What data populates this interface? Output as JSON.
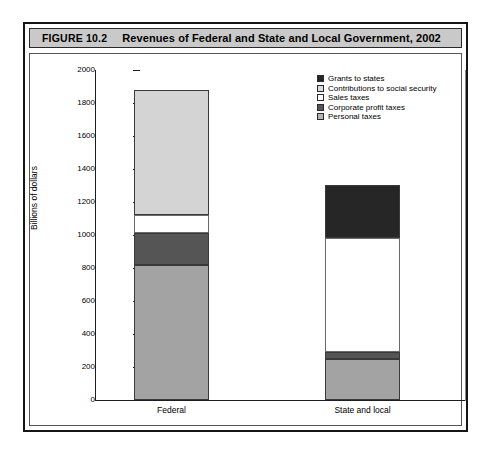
{
  "figure": {
    "label": "FIGURE 10.2",
    "title": "Revenues of Federal and State and Local Government, 2002"
  },
  "chart_data": {
    "type": "bar",
    "stacked": true,
    "title": "Revenues of Federal and State and Local Government, 2002",
    "xlabel": "",
    "ylabel": "Billions of dollars",
    "categories": [
      "Federal",
      "State and local"
    ],
    "ylim": [
      0,
      2000
    ],
    "ytick_step": 200,
    "yticks": [
      2000,
      1800,
      1600,
      1400,
      1200,
      1000,
      800,
      600,
      400,
      200,
      0
    ],
    "grid": false,
    "legend_position": "top-right",
    "series": [
      {
        "name": "Grants to states",
        "color": "#262626",
        "values": [
          0,
          325
        ]
      },
      {
        "name": "Contributions to social security",
        "color": "#d4d4d4",
        "values": [
          760,
          0
        ]
      },
      {
        "name": "Sales taxes",
        "color": "#ffffff",
        "values": [
          105,
          690
        ]
      },
      {
        "name": "Corporate profit taxes",
        "color": "#555555",
        "values": [
          195,
          40
        ]
      },
      {
        "name": "Personal taxes",
        "color": "#a3a3a3",
        "values": [
          820,
          250
        ]
      }
    ],
    "totals": [
      1880,
      1305
    ],
    "stack_order_bottom_to_top": [
      "Personal taxes",
      "Corporate profit taxes",
      "Sales taxes",
      "Contributions to social security",
      "Grants to states"
    ]
  },
  "legend": {
    "items": [
      {
        "label": "Grants to states",
        "color": "#262626"
      },
      {
        "label": "Contributions to social security",
        "color": "#dcdcdc"
      },
      {
        "label": "Sales taxes",
        "color": "#ffffff"
      },
      {
        "label": "Corporate profit taxes",
        "color": "#555555"
      },
      {
        "label": "Personal taxes",
        "color": "#b5b5b5"
      }
    ]
  },
  "axis": {
    "y_title": "Billions of dollars",
    "y_ticks": [
      "2000",
      "1800",
      "1600",
      "1400",
      "1200",
      "1000",
      "800",
      "600",
      "400",
      "200",
      "0"
    ],
    "x_ticks": [
      "Federal",
      "State and local"
    ]
  }
}
